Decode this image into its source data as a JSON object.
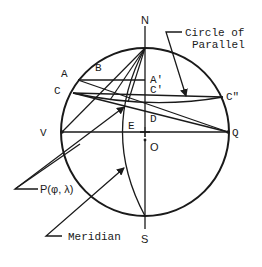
{
  "diagram": {
    "type": "celestial-sphere-construction",
    "points": {
      "N": "N",
      "S": "S",
      "V": "V",
      "Q": "Q",
      "E": "E",
      "O": "O",
      "D": "D",
      "A": "A",
      "B": "B",
      "C": "C",
      "A_prime": "A'",
      "C_prime": "C'",
      "C_double_prime": "C\""
    },
    "annotations": {
      "circle_of_parallel_line1": "Circle of",
      "circle_of_parallel_line2": "Parallel",
      "point_p": "P(φ, λ)",
      "meridian": "Meridian"
    },
    "colors": {
      "ink": "#1a1a1a",
      "background": "#ffffff"
    }
  }
}
